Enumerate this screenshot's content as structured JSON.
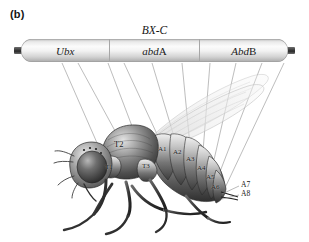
{
  "figure": {
    "panel_label": "(b)",
    "complex_title": "BX-C"
  },
  "gene_bar": {
    "genes": [
      {
        "italic_part": "Ubx",
        "upright_part": "",
        "name": "Ubx"
      },
      {
        "italic_part": "abd",
        "upright_part": "A",
        "name": "abdA"
      },
      {
        "italic_part": "Abd",
        "upright_part": "B",
        "name": "AbdB"
      }
    ],
    "cap_color": "#3a3a3a",
    "bar_fill": "#f2f2f2"
  },
  "fly": {
    "alt": "Drosophila adult lateral view illustration",
    "thorax_segments": [
      {
        "label": "T1",
        "x": 112,
        "y": 170
      },
      {
        "label": "T2",
        "x": 118,
        "y": 145
      },
      {
        "label": "T3",
        "x": 146,
        "y": 167
      }
    ],
    "abdomen_segments": [
      {
        "label": "A1",
        "x": 163,
        "y": 151
      },
      {
        "label": "A2",
        "x": 177,
        "y": 154
      },
      {
        "label": "A3",
        "x": 190,
        "y": 160
      },
      {
        "label": "A4",
        "x": 201,
        "y": 168
      },
      {
        "label": "A5",
        "x": 210,
        "y": 177
      },
      {
        "label": "A6",
        "x": 214,
        "y": 186
      }
    ],
    "external_labels": [
      {
        "label": "A7",
        "x": 243,
        "y": 183
      },
      {
        "label": "A8",
        "x": 243,
        "y": 192
      }
    ]
  },
  "colors": {
    "background": "#ffffff",
    "text": "#141414",
    "leader_line": "#8c8c8c",
    "body_dark": "#4a4a4a",
    "body_light": "#d8d8d8",
    "wing": "#cfcfcf"
  }
}
